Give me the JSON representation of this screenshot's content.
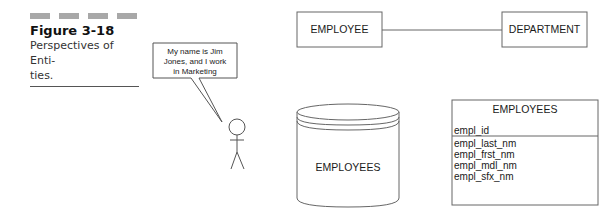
{
  "caption": {
    "figure_number": "Figure 3-18",
    "title_line1": "Perspectives of Enti-",
    "title_line2": "ties."
  },
  "speech_bubble": {
    "line1": "My name is Jim",
    "line2": "Jones, and I work",
    "line3": "in Marketing"
  },
  "er_diagram": {
    "entity_left": "EMPLOYEE",
    "entity_right": "DEPARTMENT"
  },
  "database": {
    "label": "EMPLOYEES"
  },
  "table": {
    "name": "EMPLOYEES",
    "primary_key": "empl_id",
    "attributes": [
      "empl_last_nm",
      "empl_frst_nm",
      "empl_mdl_nm",
      "empl_sfx_nm"
    ]
  },
  "colors": {
    "line": "#555555",
    "caption_bars": "#a8a8a8"
  }
}
